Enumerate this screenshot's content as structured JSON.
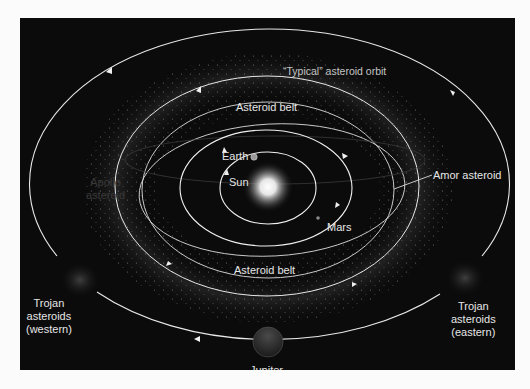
{
  "diagram": {
    "colors": {
      "background": "#0b0b0b",
      "page": "#fbfbfb",
      "orbit": "#e8e8e8",
      "label": "#e6e6e6",
      "sun": "#ffffff"
    },
    "labels": {
      "typical_orbit": "“Typical” asteroid orbit",
      "asteroid_belt_top": "Asteroid belt",
      "asteroid_belt_bottom": "Asteroid belt",
      "earth": "Earth",
      "sun": "Sun",
      "mars": "Mars",
      "amor": "Amor asteroid",
      "apollo_line1": "Apollo",
      "apollo_line2": "asteroid",
      "trojan_west_line1": "Trojan",
      "trojan_west_line2": "asteroids",
      "trojan_west_line3": "(western)",
      "trojan_east_line1": "Trojan",
      "trojan_east_line2": "asteroids",
      "trojan_east_line3": "(eastern)",
      "jupiter": "Jupiter"
    },
    "bodies": [
      {
        "name": "Sun",
        "x": 268,
        "y": 187
      },
      {
        "name": "Earth",
        "x": 254,
        "y": 157
      },
      {
        "name": "Jupiter",
        "x": 268,
        "y": 342
      }
    ],
    "orbits": [
      {
        "name": "Earth orbit",
        "cx": 268,
        "cy": 187,
        "rx": 48,
        "ry": 36
      },
      {
        "name": "Mars orbit",
        "cx": 266,
        "cy": 188,
        "rx": 86,
        "ry": 58
      },
      {
        "name": "Amor asteroid orbit",
        "cx": 275,
        "cy": 185,
        "rx": 133,
        "ry": 64
      },
      {
        "name": "Asteroid belt inner",
        "cx": 268,
        "cy": 188,
        "rx": 125,
        "ry": 88
      },
      {
        "name": "Typical asteroid orbit",
        "cx": 267,
        "cy": 186,
        "rx": 152,
        "ry": 110
      },
      {
        "name": "Jupiter orbit",
        "cx": 268,
        "cy": 187,
        "rx": 240,
        "ry": 155
      }
    ]
  }
}
